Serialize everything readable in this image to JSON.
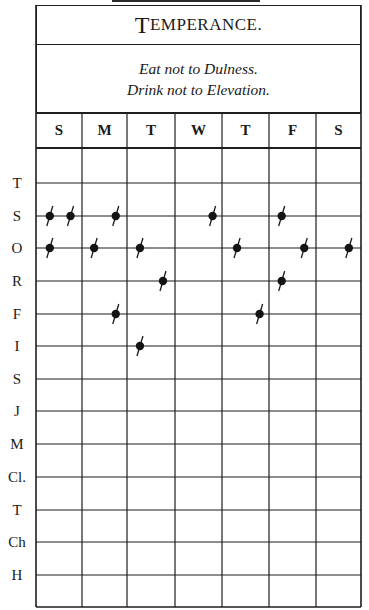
{
  "chart": {
    "title_initial": "T",
    "title_rest": "EMPERANCE.",
    "motto_lines": [
      "Eat not to Dulness.",
      "Drink not to Elevation."
    ],
    "days": [
      "S",
      "M",
      "T",
      "W",
      "T",
      "F",
      "S"
    ],
    "virtues": [
      "T",
      "S",
      "O",
      "R",
      "F",
      "I",
      "S",
      "J",
      "M",
      "Cl.",
      "T",
      "Ch",
      "H"
    ]
  },
  "marks": {
    "description": "Faults recorded per virtue (row) per day (column index 0-6), with offset within cell (0=left,1=right)",
    "entries": [
      {
        "virtue_index": 1,
        "day_index": 0,
        "offset": 0.3
      },
      {
        "virtue_index": 1,
        "day_index": 0,
        "offset": 0.75
      },
      {
        "virtue_index": 1,
        "day_index": 1,
        "offset": 0.75
      },
      {
        "virtue_index": 1,
        "day_index": 3,
        "offset": 0.8
      },
      {
        "virtue_index": 1,
        "day_index": 5,
        "offset": 0.27
      },
      {
        "virtue_index": 2,
        "day_index": 0,
        "offset": 0.3
      },
      {
        "virtue_index": 2,
        "day_index": 1,
        "offset": 0.27
      },
      {
        "virtue_index": 2,
        "day_index": 2,
        "offset": 0.27
      },
      {
        "virtue_index": 2,
        "day_index": 4,
        "offset": 0.32
      },
      {
        "virtue_index": 2,
        "day_index": 5,
        "offset": 0.75
      },
      {
        "virtue_index": 2,
        "day_index": 6,
        "offset": 0.73
      },
      {
        "virtue_index": 3,
        "day_index": 2,
        "offset": 0.75
      },
      {
        "virtue_index": 3,
        "day_index": 5,
        "offset": 0.27
      },
      {
        "virtue_index": 4,
        "day_index": 1,
        "offset": 0.75
      },
      {
        "virtue_index": 4,
        "day_index": 4,
        "offset": 0.8
      },
      {
        "virtue_index": 5,
        "day_index": 2,
        "offset": 0.27
      }
    ]
  }
}
